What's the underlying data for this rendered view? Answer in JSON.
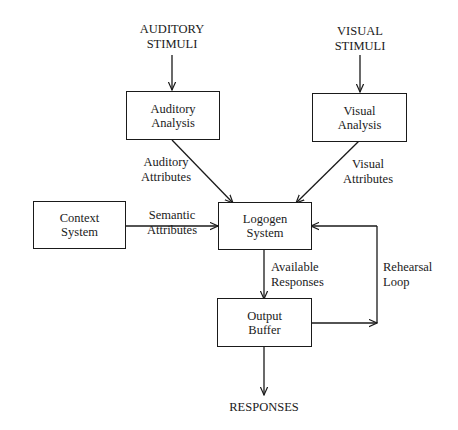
{
  "diagram": {
    "type": "flowchart",
    "inputs": {
      "auditory": [
        "AUDITORY",
        "STIMULI"
      ],
      "visual": [
        "VISUAL",
        "STIMULI"
      ]
    },
    "nodes": {
      "auditory_analysis": [
        "Auditory",
        "Analysis"
      ],
      "visual_analysis": [
        "Visual",
        "Analysis"
      ],
      "context_system": [
        "Context",
        "System"
      ],
      "logogen_system": [
        "Logogen",
        "System"
      ],
      "output_buffer": [
        "Output",
        "Buffer"
      ]
    },
    "edge_labels": {
      "auditory_attributes": [
        "Auditory",
        "Attributes"
      ],
      "visual_attributes": [
        "Visual",
        "Attributes"
      ],
      "semantic_attributes": [
        "Semantic",
        "Attributes"
      ],
      "available_responses": [
        "Available",
        "Responses"
      ],
      "rehearsal_loop": [
        "Rehearsal",
        "Loop"
      ]
    },
    "output": "RESPONSES",
    "edges": [
      {
        "from": "AUDITORY STIMULI",
        "to": "Auditory Analysis"
      },
      {
        "from": "VISUAL STIMULI",
        "to": "Visual Analysis"
      },
      {
        "from": "Auditory Analysis",
        "to": "Logogen System",
        "label": "Auditory Attributes"
      },
      {
        "from": "Visual Analysis",
        "to": "Logogen System",
        "label": "Visual Attributes"
      },
      {
        "from": "Context System",
        "to": "Logogen System",
        "label": "Semantic Attributes"
      },
      {
        "from": "Logogen System",
        "to": "Output Buffer",
        "label": "Available Responses"
      },
      {
        "from": "Output Buffer",
        "to": "Logogen System",
        "label": "Rehearsal Loop"
      },
      {
        "from": "Output Buffer",
        "to": "RESPONSES"
      }
    ]
  }
}
